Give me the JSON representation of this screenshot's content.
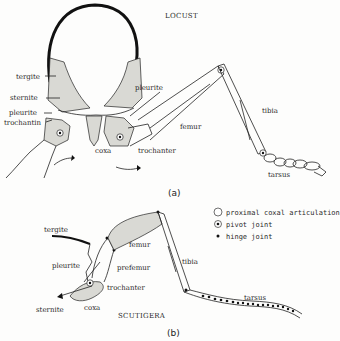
{
  "figure": {
    "panel_a": {
      "title": "LOCUST",
      "tag": "(a)",
      "labels": {
        "tergite": "tergite",
        "sternite": "sternite",
        "pleurite_left": "pleurite",
        "trochantin": "trochantin",
        "pleurite_right": "pleurite",
        "coxa": "coxa",
        "trochanter": "trochanter",
        "femur": "femur",
        "tibia": "tibia",
        "tarsus": "tarsus"
      }
    },
    "panel_b": {
      "title": "SCUTIGERA",
      "tag": "(b)",
      "labels": {
        "tergite": "tergite",
        "pleurite": "pleurite",
        "sternite": "sternite",
        "coxa": "coxa",
        "trochanter": "trochanter",
        "prefemur": "prefemur",
        "femur": "femur",
        "tibia": "tibia",
        "tarsus": "tarsus"
      }
    },
    "legend": [
      {
        "symbol": "open-circle-icon",
        "label": "proximal coxal articulation"
      },
      {
        "symbol": "dotted-circle-icon",
        "label": "pivot joint"
      },
      {
        "symbol": "filled-dot-icon",
        "label": "hinge joint"
      }
    ]
  }
}
